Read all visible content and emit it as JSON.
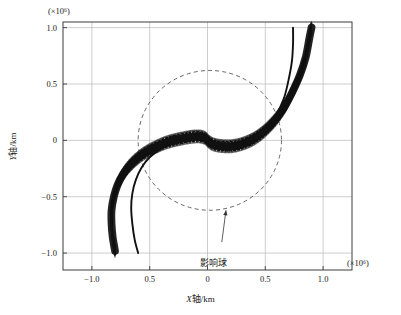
{
  "figure": {
    "background_color": "#ffffff",
    "frame_color": "#3c3c3c",
    "grid_color": "#b9b9b9",
    "curve_color": "#111111",
    "soi_color": "#555555"
  },
  "axes": {
    "x_label_prefix": "X",
    "x_label_suffix": "轴/km",
    "y_label_prefix": "Y",
    "y_label_suffix": "轴/km",
    "x_exponent_label": "(×10⁶)",
    "y_exponent_label": "(×10⁶)",
    "x_ticks": [
      "−1.0",
      "0.5",
      "0",
      "0.5",
      "1.0"
    ],
    "y_ticks": [
      "1.0",
      "0.5",
      "0",
      "−0.5",
      "−1.0"
    ]
  },
  "annotations": {
    "sphere_of_influence_label": "影响球"
  },
  "chart_data": {
    "type": "scatter",
    "title": "",
    "xlabel": "X轴/km (×10⁶)",
    "ylabel": "Y轴/km (×10⁶)",
    "xlim": [
      -1.25,
      1.25
    ],
    "ylim": [
      -1.15,
      1.05
    ],
    "x_tick_values": [
      -1.0,
      -0.5,
      0.0,
      0.5,
      1.0
    ],
    "y_tick_values": [
      1.0,
      0.5,
      0.0,
      -0.5,
      -1.0
    ],
    "grid": true,
    "legend": "none",
    "annotations": [
      {
        "text": "影响球",
        "target_x": 0.16,
        "target_y": -0.62,
        "label_x": 0.02,
        "label_y": -0.92,
        "kind": "arrow"
      }
    ],
    "sphere_of_influence": {
      "center_x": 0.02,
      "center_y": 0.0,
      "radius": 0.62,
      "style": "dashed"
    },
    "series": [
      {
        "name": "trajectory-bundle-dense",
        "style": "dotted-band",
        "band_half_width": 0.055,
        "points": [
          {
            "x": -0.8,
            "y": -0.98
          },
          {
            "x": -0.82,
            "y": -0.86
          },
          {
            "x": -0.83,
            "y": -0.74
          },
          {
            "x": -0.83,
            "y": -0.62
          },
          {
            "x": -0.81,
            "y": -0.5
          },
          {
            "x": -0.78,
            "y": -0.4
          },
          {
            "x": -0.73,
            "y": -0.3
          },
          {
            "x": -0.66,
            "y": -0.21
          },
          {
            "x": -0.57,
            "y": -0.13
          },
          {
            "x": -0.47,
            "y": -0.07
          },
          {
            "x": -0.36,
            "y": -0.02
          },
          {
            "x": -0.25,
            "y": 0.01
          },
          {
            "x": -0.15,
            "y": 0.03
          },
          {
            "x": -0.07,
            "y": 0.035
          },
          {
            "x": -0.02,
            "y": 0.02
          },
          {
            "x": 0.01,
            "y": -0.01
          },
          {
            "x": 0.05,
            "y": -0.035
          },
          {
            "x": 0.12,
            "y": -0.05
          },
          {
            "x": 0.22,
            "y": -0.05
          },
          {
            "x": 0.33,
            "y": -0.02
          },
          {
            "x": 0.44,
            "y": 0.04
          },
          {
            "x": 0.55,
            "y": 0.14
          },
          {
            "x": 0.65,
            "y": 0.27
          },
          {
            "x": 0.73,
            "y": 0.42
          },
          {
            "x": 0.8,
            "y": 0.58
          },
          {
            "x": 0.85,
            "y": 0.74
          },
          {
            "x": 0.88,
            "y": 0.9
          },
          {
            "x": 0.9,
            "y": 1.0
          }
        ]
      },
      {
        "name": "trajectory-thin-left",
        "style": "solid-thin",
        "points": [
          {
            "x": -0.6,
            "y": -1.0
          },
          {
            "x": -0.63,
            "y": -0.88
          },
          {
            "x": -0.65,
            "y": -0.74
          },
          {
            "x": -0.66,
            "y": -0.6
          },
          {
            "x": -0.65,
            "y": -0.47
          },
          {
            "x": -0.62,
            "y": -0.35
          },
          {
            "x": -0.57,
            "y": -0.24
          },
          {
            "x": -0.5,
            "y": -0.15
          },
          {
            "x": -0.41,
            "y": -0.08
          },
          {
            "x": -0.31,
            "y": -0.03
          },
          {
            "x": -0.2,
            "y": 0.005
          },
          {
            "x": -0.1,
            "y": 0.02
          },
          {
            "x": -0.03,
            "y": 0.015
          },
          {
            "x": 0.01,
            "y": -0.005
          }
        ]
      },
      {
        "name": "trajectory-thin-right",
        "style": "solid-thin",
        "points": [
          {
            "x": 0.01,
            "y": -0.005
          },
          {
            "x": 0.08,
            "y": -0.035
          },
          {
            "x": 0.18,
            "y": -0.045
          },
          {
            "x": 0.29,
            "y": -0.025
          },
          {
            "x": 0.4,
            "y": 0.02
          },
          {
            "x": 0.5,
            "y": 0.1
          },
          {
            "x": 0.59,
            "y": 0.22
          },
          {
            "x": 0.66,
            "y": 0.37
          },
          {
            "x": 0.7,
            "y": 0.53
          },
          {
            "x": 0.73,
            "y": 0.7
          },
          {
            "x": 0.74,
            "y": 0.86
          },
          {
            "x": 0.74,
            "y": 1.0
          }
        ]
      }
    ]
  }
}
